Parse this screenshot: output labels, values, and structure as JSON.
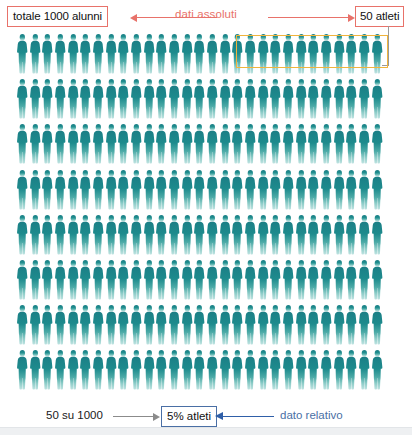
{
  "top": {
    "left_box_label": "totale 1000 alunni",
    "center_label": "dati assoluti",
    "right_box_label": "50 atleti",
    "left_arrow_icon": "arrow-left-icon",
    "right_arrow_icon": "arrow-right-icon",
    "accent_color": "#e8726a"
  },
  "highlight": {
    "name": "athletes-highlight-box",
    "border_color": "#f0b43c",
    "figures_highlighted": 10,
    "connector_color": "#9a9a9a"
  },
  "bottom": {
    "ratio_label": "50 su 1000",
    "result_box_label": "5% atleti",
    "right_label": "dato relativo",
    "gray_arrow_icon": "arrow-right-icon",
    "blue_arrow_icon": "arrow-left-icon",
    "result_border_color": "#4a6fa5",
    "accent_color": "#2f5fa8"
  },
  "chart_data": {
    "type": "pictogram",
    "title": "totale 1000 alunni",
    "rows": 8,
    "columns": 29,
    "total_figures": 232,
    "figure_unit_label": "alunni",
    "figure_color_top": "#1b7f86",
    "figure_color_bottom": "#bfe3e1",
    "highlighted_count": 10,
    "highlighted_label": "50 atleti",
    "highlight_color": "#f0b43c",
    "represented_total": 1000,
    "represented_subset": 50,
    "subset_percent": 5,
    "annotations": [
      "totale 1000 alunni",
      "dati assoluti",
      "50 atleti",
      "50 su 1000",
      "5% atleti",
      "dato relativo"
    ]
  }
}
